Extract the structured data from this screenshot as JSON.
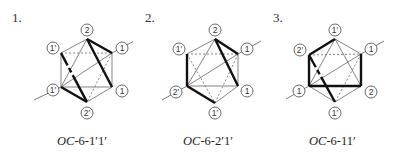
{
  "diagrams": [
    {
      "number": "1.",
      "caption_prefix": "OC",
      "caption_suffix": "-6-1′1′",
      "labels": {
        "top": "2",
        "upper_left": "1′",
        "upper_right": "1",
        "lower_left": "1′",
        "lower_right": "1",
        "bottom": "2′"
      }
    },
    {
      "number": "2.",
      "caption_prefix": "OC",
      "caption_suffix": "-6-2′1′",
      "labels": {
        "top": "2",
        "upper_left": "1′",
        "upper_right": "1",
        "lower_left": "2′",
        "lower_right": "1",
        "bottom": "1′"
      }
    },
    {
      "number": "3.",
      "caption_prefix": "OC",
      "caption_suffix": "-6-11′",
      "labels": {
        "top": "1′",
        "upper_left": "2′",
        "upper_right": "1",
        "lower_left": "1",
        "lower_right": "2",
        "bottom": "1′"
      }
    }
  ],
  "colors": {
    "line": "#555555",
    "thick": "#111111",
    "text": "#222222"
  }
}
